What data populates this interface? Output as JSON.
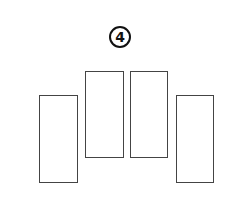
{
  "figure": {
    "label": "4",
    "shapes": [
      {
        "name": "rectangle-1",
        "x": 39,
        "y": 95,
        "w": 39,
        "h": 88
      },
      {
        "name": "rectangle-2",
        "x": 85,
        "y": 71,
        "w": 39,
        "h": 87
      },
      {
        "name": "rectangle-3",
        "x": 130,
        "y": 71,
        "w": 38,
        "h": 87
      },
      {
        "name": "rectangle-4",
        "x": 176,
        "y": 95,
        "w": 38,
        "h": 88
      }
    ],
    "stroke_color": "#444444",
    "label_color": "#111111"
  }
}
